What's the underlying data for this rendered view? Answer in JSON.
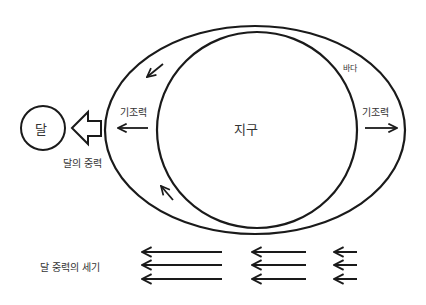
{
  "diagram": {
    "moon_label": "달",
    "earth_label": "지구",
    "ocean_label": "바다",
    "tide_force_left": "기조력",
    "tide_force_right": "기조력",
    "moon_gravity_label": "달의 중력",
    "gravity_strength_label": "달 중력의 세기",
    "stroke_color": "#1a1a1a",
    "background_color": "#ffffff"
  }
}
